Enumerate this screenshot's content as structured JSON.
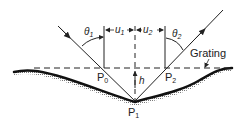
{
  "diagram": {
    "labels": {
      "theta1": "θ",
      "theta1_sub": "1",
      "theta2": "θ",
      "theta2_sub": "2",
      "u1": "u",
      "u1_sub": "1",
      "u2": "u",
      "u2_sub": "2",
      "grating": "Grating",
      "h": "h",
      "p0": "P",
      "p0_sub": "0",
      "p1": "P",
      "p1_sub": "1",
      "p2": "P",
      "p2_sub": "2"
    },
    "colors": {
      "line": "#222222",
      "surface": "#111111",
      "shading": "#888888"
    }
  }
}
